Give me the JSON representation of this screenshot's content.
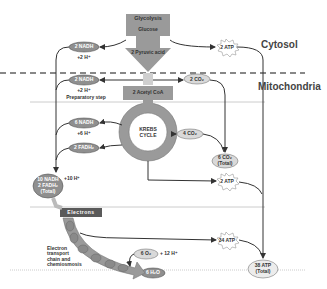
{
  "diagram": {
    "regions": {
      "cytosol": "Cytosol",
      "mitochondria": "Mitochondria"
    },
    "glycolysis": {
      "label": "Glycolysis",
      "input": "Glucose",
      "output": "2 Pyruvic acid",
      "nadh": "2 NADH",
      "h_plus": "+2 H⁺",
      "atp": "2 ATP"
    },
    "preparatory_step": {
      "label": "Preparatory step",
      "nadh": "2 NADH",
      "h_plus": "+2 H⁺",
      "co2": "2 CO₂",
      "product": "2 Acetyl CoA"
    },
    "krebs": {
      "label_line1": "KREBS",
      "label_line2": "CYCLE",
      "nadh": "6 NADH",
      "h_plus": "+6 H⁺",
      "fadh2": "2 FADH₂",
      "co2": "4 CO₂",
      "co2_total_line1": "6 CO₂",
      "co2_total_line2": "(Total)",
      "atp": "2 ATP"
    },
    "totals": {
      "nadh_line1": "10 NADH",
      "nadh_line2": "2 FADH₂",
      "nadh_line3": "(Total)",
      "h_plus": "+10 H⁺"
    },
    "etc": {
      "electrons": "Electrons",
      "label_line1": "Electron",
      "label_line2": "transport",
      "label_line3": "chain and",
      "label_line4": "chemiosmosis",
      "o2": "6 O₂",
      "h_plus": "+ 12 H⁺",
      "water": "6 H₂O",
      "atp": "34 ATP"
    },
    "atp_total_line1": "38 ATP",
    "atp_total_line2": "(Total)",
    "colors": {
      "box_gray": "#9a9a9a",
      "ellipse_gray": "#8f8f8f",
      "light_ellipse": "#d9d9d9",
      "line": "#333333",
      "dark_box": "#5a5a5a"
    }
  }
}
